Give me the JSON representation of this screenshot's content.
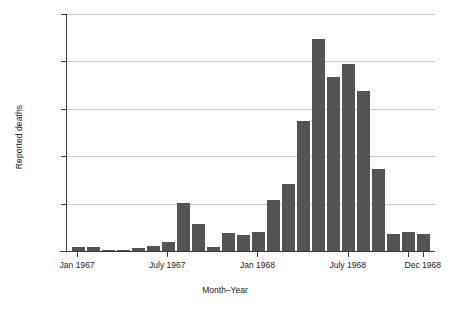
{
  "chart_data": {
    "type": "bar",
    "title": "",
    "xlabel": "Month–Year",
    "ylabel": "Reported deaths",
    "ylim": [
      0,
      25000
    ],
    "yticks": [
      0,
      5000,
      10000,
      15000,
      20000,
      25000
    ],
    "ytick_labels": [
      "0",
      "5000",
      "10000",
      "15000",
      "20000",
      "25000"
    ],
    "grid": true,
    "legend": "none",
    "xtick_labels": [
      "Jan 1967",
      "July 1967",
      "Jan 1968",
      "July 1968",
      "Dec 1968"
    ],
    "xtick_categories": [
      "Jan 1967",
      "July 1967",
      "Jan 1968",
      "July 1968",
      "Dec 1968"
    ],
    "categories": [
      "Jan 1967",
      "Feb 1967",
      "Mar 1967",
      "Apr 1967",
      "May 1967",
      "Jun 1967",
      "July 1967",
      "Aug 1967",
      "Sep 1967",
      "Oct 1967",
      "Nov 1967",
      "Dec 1967",
      "Jan 1968",
      "Feb 1968",
      "Mar 1968",
      "Apr 1968",
      "May 1968",
      "Jun 1968",
      "July 1968",
      "Aug 1968",
      "Sep 1968",
      "Oct 1968",
      "Nov 1968",
      "Dec 1968"
    ],
    "values": [
      400,
      400,
      150,
      100,
      350,
      500,
      900,
      5050,
      2800,
      400,
      1900,
      1650,
      2000,
      5400,
      7100,
      13700,
      22400,
      18400,
      19700,
      16900,
      8600,
      1750,
      2050,
      1750
    ],
    "bar_color": "#545454",
    "grid_color": "#c9c9c9",
    "axis_color": "#3a3a3a",
    "background": "#ffffff"
  }
}
